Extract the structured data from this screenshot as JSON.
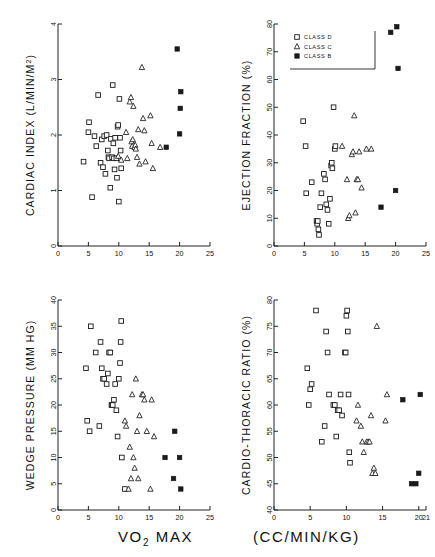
{
  "figure": {
    "xlabel_main": "VO",
    "xlabel_sub": "2",
    "xlabel_rest": " MAX",
    "xlabel_units": "(CC/MIN/KG)"
  },
  "legend": {
    "position": "top-left-of-ejection-fraction-panel",
    "entries": [
      {
        "marker": "open-square",
        "label": "CLASS D"
      },
      {
        "marker": "triangle",
        "label": "CLASS C"
      },
      {
        "marker": "filled-square",
        "label": "CLASS B"
      }
    ]
  },
  "chart_data": [
    {
      "id": "cardiac-index",
      "type": "scatter",
      "title": "",
      "xlabel": "VO2 MAX (CC/MIN/KG)",
      "ylabel": "CARDIAC INDEX (L/MIN/M2)",
      "ylabel_main": "CARDIAC INDEX",
      "ylabel_units": "(L/MIN/M",
      "ylabel_sup": "2",
      "ylabel_close": ")",
      "xlim": [
        0,
        25
      ],
      "ylim": [
        0,
        4
      ],
      "xticks": [
        0,
        5,
        10,
        15,
        20,
        25
      ],
      "yticks": [
        0,
        1,
        2,
        3,
        4
      ],
      "grid": false,
      "series": [
        {
          "name": "CLASS D",
          "marker": "open-square",
          "points": [
            [
              4.2,
              1.52
            ],
            [
              5.0,
              2.05
            ],
            [
              5.1,
              2.23
            ],
            [
              5.6,
              0.88
            ],
            [
              6.0,
              1.98
            ],
            [
              6.3,
              1.8
            ],
            [
              6.6,
              2.72
            ],
            [
              7.0,
              1.5
            ],
            [
              7.2,
              1.92
            ],
            [
              7.4,
              1.42
            ],
            [
              7.6,
              1.98
            ],
            [
              7.8,
              1.3
            ],
            [
              8.0,
              2.0
            ],
            [
              8.2,
              1.72
            ],
            [
              8.3,
              1.6
            ],
            [
              8.4,
              1.58
            ],
            [
              8.6,
              1.05
            ],
            [
              8.7,
              1.93
            ],
            [
              8.9,
              1.6
            ],
            [
              9.0,
              2.9
            ],
            [
              9.1,
              1.85
            ],
            [
              9.2,
              1.58
            ],
            [
              9.3,
              1.38
            ],
            [
              9.4,
              1.95
            ],
            [
              9.6,
              1.58
            ],
            [
              9.7,
              1.23
            ],
            [
              9.8,
              2.15
            ],
            [
              9.9,
              2.18
            ],
            [
              10.0,
              0.8
            ],
            [
              10.1,
              2.65
            ],
            [
              10.2,
              1.95
            ],
            [
              10.3,
              1.72
            ],
            [
              10.4,
              1.4
            ]
          ]
        },
        {
          "name": "CLASS C",
          "marker": "triangle",
          "points": [
            [
              9.9,
              1.62
            ],
            [
              10.4,
              1.55
            ],
            [
              11.2,
              2.05
            ],
            [
              11.4,
              1.58
            ],
            [
              11.8,
              2.6
            ],
            [
              12.0,
              2.68
            ],
            [
              12.1,
              1.88
            ],
            [
              12.2,
              1.8
            ],
            [
              12.3,
              1.92
            ],
            [
              12.4,
              2.52
            ],
            [
              12.6,
              1.78
            ],
            [
              12.7,
              1.82
            ],
            [
              12.8,
              1.75
            ],
            [
              13.0,
              1.6
            ],
            [
              13.2,
              2.1
            ],
            [
              13.4,
              1.48
            ],
            [
              13.8,
              3.22
            ],
            [
              14.0,
              2.3
            ],
            [
              14.2,
              2.08
            ],
            [
              14.4,
              1.52
            ],
            [
              15.2,
              2.35
            ],
            [
              15.4,
              1.85
            ],
            [
              15.6,
              1.4
            ],
            [
              16.8,
              1.78
            ]
          ]
        },
        {
          "name": "CLASS B",
          "marker": "filled-square",
          "points": [
            [
              17.8,
              1.78
            ],
            [
              19.6,
              3.55
            ],
            [
              20.0,
              2.02
            ],
            [
              20.1,
              2.48
            ],
            [
              20.2,
              2.78
            ]
          ]
        }
      ]
    },
    {
      "id": "ejection-fraction",
      "type": "scatter",
      "title": "",
      "xlabel": "VO2 MAX (CC/MIN/KG)",
      "ylabel": "EJECTION FRACTION (%)",
      "ylabel_main": "EJECTION FRACTION",
      "ylabel_units": "(%)",
      "xlim": [
        0,
        25
      ],
      "ylim": [
        0,
        80
      ],
      "xticks": [
        0,
        5,
        10,
        15,
        20,
        25
      ],
      "yticks": [
        0,
        10,
        20,
        30,
        40,
        50,
        60,
        70,
        80
      ],
      "grid": false,
      "series": [
        {
          "name": "CLASS D",
          "marker": "open-square",
          "points": [
            [
              4.8,
              45
            ],
            [
              5.2,
              36
            ],
            [
              5.3,
              19
            ],
            [
              6.2,
              23
            ],
            [
              7.0,
              9
            ],
            [
              7.1,
              8
            ],
            [
              7.2,
              9
            ],
            [
              7.3,
              6
            ],
            [
              7.4,
              4
            ],
            [
              7.6,
              14
            ],
            [
              7.8,
              19
            ],
            [
              8.2,
              26
            ],
            [
              8.4,
              24
            ],
            [
              8.6,
              15
            ],
            [
              8.8,
              13
            ],
            [
              9.0,
              8
            ],
            [
              9.2,
              17
            ],
            [
              9.4,
              29
            ],
            [
              9.5,
              30
            ],
            [
              9.6,
              28
            ],
            [
              9.8,
              50
            ],
            [
              10.0,
              35
            ],
            [
              10.1,
              36
            ]
          ]
        },
        {
          "name": "CLASS C",
          "marker": "triangle",
          "points": [
            [
              11.2,
              36
            ],
            [
              12.0,
              24
            ],
            [
              12.2,
              10
            ],
            [
              12.4,
              11
            ],
            [
              12.8,
              33
            ],
            [
              13.0,
              34
            ],
            [
              13.2,
              47
            ],
            [
              13.4,
              12
            ],
            [
              13.6,
              24
            ],
            [
              13.8,
              24
            ],
            [
              14.0,
              34
            ],
            [
              14.4,
              21
            ],
            [
              15.2,
              35
            ],
            [
              16.0,
              35
            ]
          ]
        },
        {
          "name": "CLASS B",
          "marker": "filled-square",
          "points": [
            [
              17.6,
              14
            ],
            [
              19.2,
              77
            ],
            [
              20.0,
              20
            ],
            [
              20.2,
              79
            ],
            [
              20.4,
              64
            ]
          ]
        }
      ]
    },
    {
      "id": "wedge-pressure",
      "type": "scatter",
      "title": "",
      "xlabel": "VO2 MAX (CC/MIN/KG)",
      "ylabel": "WEDGE PRESSURE (MM HG)",
      "ylabel_main": "WEDGE PRESSURE",
      "ylabel_units": "(MM HG)",
      "xlim": [
        0,
        25
      ],
      "ylim": [
        0,
        40
      ],
      "xticks": [
        0,
        5,
        10,
        15,
        20,
        25
      ],
      "yticks": [
        0,
        5,
        10,
        15,
        20,
        25,
        30,
        35,
        40
      ],
      "grid": false,
      "series": [
        {
          "name": "CLASS D",
          "marker": "open-square",
          "points": [
            [
              4.6,
              27
            ],
            [
              4.8,
              17
            ],
            [
              5.2,
              15
            ],
            [
              5.4,
              35
            ],
            [
              6.2,
              30
            ],
            [
              6.8,
              16
            ],
            [
              7.0,
              32
            ],
            [
              7.2,
              27
            ],
            [
              7.4,
              25
            ],
            [
              7.6,
              25
            ],
            [
              8.0,
              24
            ],
            [
              8.2,
              26
            ],
            [
              8.4,
              30
            ],
            [
              8.6,
              30
            ],
            [
              8.8,
              20
            ],
            [
              8.9,
              20
            ],
            [
              9.0,
              20
            ],
            [
              9.2,
              21
            ],
            [
              9.4,
              24
            ],
            [
              9.6,
              19
            ],
            [
              9.8,
              14
            ],
            [
              10.0,
              25
            ],
            [
              10.2,
              28
            ],
            [
              10.3,
              32
            ],
            [
              10.4,
              36
            ],
            [
              10.5,
              10
            ],
            [
              11.0,
              4
            ]
          ]
        },
        {
          "name": "CLASS C",
          "marker": "triangle",
          "points": [
            [
              11.0,
              17
            ],
            [
              11.2,
              16
            ],
            [
              11.6,
              4
            ],
            [
              11.8,
              12
            ],
            [
              12.0,
              6
            ],
            [
              12.2,
              22
            ],
            [
              12.4,
              10
            ],
            [
              12.6,
              8
            ],
            [
              12.8,
              25
            ],
            [
              13.0,
              15
            ],
            [
              13.2,
              6
            ],
            [
              13.4,
              18
            ],
            [
              13.8,
              22
            ],
            [
              14.0,
              22
            ],
            [
              14.2,
              21
            ],
            [
              14.6,
              15
            ],
            [
              15.2,
              4
            ],
            [
              15.4,
              21
            ],
            [
              15.8,
              14
            ]
          ]
        },
        {
          "name": "CLASS B",
          "marker": "filled-square",
          "points": [
            [
              17.6,
              10
            ],
            [
              19.0,
              6
            ],
            [
              19.2,
              15
            ],
            [
              20.0,
              10
            ],
            [
              20.2,
              4
            ]
          ]
        }
      ]
    },
    {
      "id": "cardio-thoracic-ratio",
      "type": "scatter",
      "title": "",
      "xlabel": "VO2 MAX (CC/MIN/KG)",
      "ylabel": "CARDIO-THORACIC RATIO (%)",
      "ylabel_main": "CARDIO-THORACIC RATIO",
      "ylabel_units": "(%)",
      "xlim": [
        0,
        21
      ],
      "ylim": [
        40,
        80
      ],
      "xticks": [
        0,
        5,
        10,
        15,
        20,
        21
      ],
      "yticks": [
        40,
        45,
        50,
        55,
        60,
        65,
        70,
        75,
        80
      ],
      "grid": false,
      "series": [
        {
          "name": "CLASS D",
          "marker": "open-square",
          "points": [
            [
              4.6,
              67
            ],
            [
              4.8,
              60
            ],
            [
              5.0,
              63
            ],
            [
              5.2,
              64
            ],
            [
              5.8,
              78
            ],
            [
              6.6,
              53
            ],
            [
              7.0,
              56
            ],
            [
              7.2,
              74
            ],
            [
              7.4,
              70
            ],
            [
              7.6,
              62
            ],
            [
              8.2,
              60
            ],
            [
              8.4,
              60
            ],
            [
              8.6,
              54
            ],
            [
              8.8,
              59
            ],
            [
              9.0,
              59
            ],
            [
              9.2,
              62
            ],
            [
              9.4,
              58
            ],
            [
              9.8,
              70
            ],
            [
              9.9,
              70
            ],
            [
              10.0,
              77
            ],
            [
              10.1,
              78
            ],
            [
              10.2,
              74
            ],
            [
              10.3,
              62
            ],
            [
              10.4,
              51
            ],
            [
              10.5,
              49
            ]
          ]
        },
        {
          "name": "CLASS C",
          "marker": "triangle",
          "points": [
            [
              11.4,
              57
            ],
            [
              11.6,
              60
            ],
            [
              12.0,
              56
            ],
            [
              12.2,
              53
            ],
            [
              12.4,
              51
            ],
            [
              12.8,
              53
            ],
            [
              13.0,
              53
            ],
            [
              13.2,
              53
            ],
            [
              13.4,
              58
            ],
            [
              13.6,
              47
            ],
            [
              13.8,
              48
            ],
            [
              14.0,
              47
            ],
            [
              14.2,
              75
            ],
            [
              15.4,
              57
            ],
            [
              15.6,
              62
            ]
          ]
        },
        {
          "name": "CLASS B",
          "marker": "filled-square",
          "points": [
            [
              17.8,
              61
            ],
            [
              19.0,
              45
            ],
            [
              19.6,
              45
            ],
            [
              20.0,
              47
            ],
            [
              20.2,
              62
            ]
          ]
        }
      ]
    }
  ]
}
